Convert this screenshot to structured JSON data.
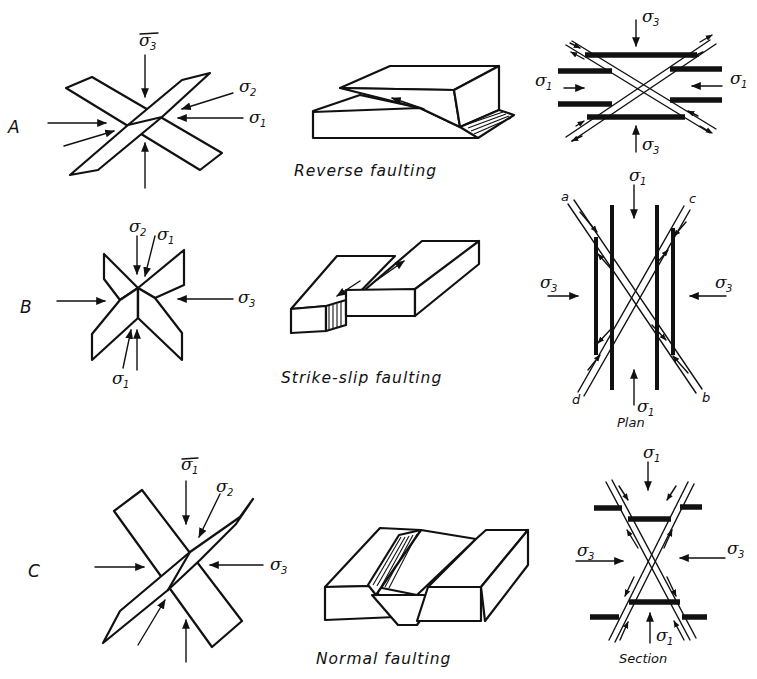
{
  "figure": {
    "rows": [
      {
        "id": "A",
        "label": "A",
        "caption": "Reverse faulting",
        "stress_labels": {
          "vertical": "σ3",
          "intermediate": "σ2",
          "horizontal": "σ1"
        },
        "plan_view": {
          "top": "σ3",
          "bottom": "σ3",
          "left": "σ1",
          "right": "σ1"
        }
      },
      {
        "id": "B",
        "label": "B",
        "caption": "Strike-slip faulting",
        "stress_labels": {
          "vertical": "σ2",
          "oblique_top": "σ1",
          "oblique_bottom": "σ1",
          "horizontal": "σ3"
        },
        "plan_view": {
          "top": "σ1",
          "bottom": "σ1",
          "left": "σ3",
          "right": "σ3",
          "corners": [
            "a",
            "c",
            "d",
            "b"
          ],
          "caption": "Plan"
        }
      },
      {
        "id": "C",
        "label": "C",
        "caption": "Normal faulting",
        "stress_labels": {
          "vertical": "σ1",
          "intermediate": "σ2",
          "horizontal": "σ3"
        },
        "section_view": {
          "top": "σ1",
          "bottom": "σ1",
          "left": "σ3",
          "right": "σ3",
          "caption": "Section"
        }
      }
    ]
  },
  "text": {
    "sigma": "σ",
    "sub1": "1",
    "sub2": "2",
    "sub3": "3",
    "rowA": "A",
    "rowB": "B",
    "rowC": "C",
    "capA": "Reverse faulting",
    "capB": "Strike-slip faulting",
    "capC": "Normal faulting",
    "plan": "Plan",
    "section": "Section",
    "corner_a": "a",
    "corner_b": "b",
    "corner_c": "c",
    "corner_d": "d"
  },
  "colors": {
    "ink": "#111111",
    "paper": "#ffffff"
  }
}
